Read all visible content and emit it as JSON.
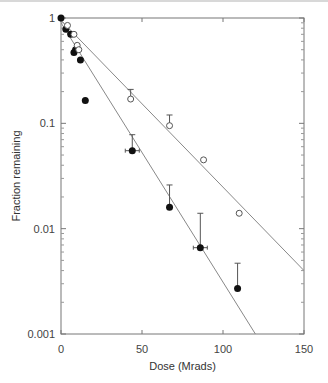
{
  "chart_data": {
    "type": "scatter",
    "title": "",
    "xlabel": "Dose (Mrads)",
    "ylabel": "Fraction remaining",
    "xlim": [
      0,
      150
    ],
    "ylim": [
      0.001,
      1
    ],
    "yscale": "log",
    "x_ticks": [
      "0",
      "50",
      "100",
      "150"
    ],
    "y_ticks": [
      "0.001",
      "0.01",
      "0.1",
      "1"
    ],
    "grid": false,
    "series": [
      {
        "name": "filled",
        "marker": "filled-circle",
        "color": "#111111",
        "points": [
          {
            "x": 0,
            "y": 1.0
          },
          {
            "x": 3,
            "y": 0.78
          },
          {
            "x": 6,
            "y": 0.7
          },
          {
            "x": 8,
            "y": 0.47
          },
          {
            "x": 9,
            "y": 0.5
          },
          {
            "x": 12,
            "y": 0.4
          },
          {
            "x": 15,
            "y": 0.165
          },
          {
            "x": 44,
            "y": 0.055
          },
          {
            "x": 67,
            "y": 0.016
          },
          {
            "x": 86,
            "y": 0.0066
          },
          {
            "x": 109,
            "y": 0.0027
          }
        ],
        "fit_line": {
          "x0": 0,
          "y0": 0.9,
          "x1": 120,
          "y1": 0.001
        }
      },
      {
        "name": "open",
        "marker": "open-circle",
        "color": "#555555",
        "points": [
          {
            "x": 4,
            "y": 0.85
          },
          {
            "x": 8,
            "y": 0.7
          },
          {
            "x": 10,
            "y": 0.55
          },
          {
            "x": 11,
            "y": 0.5
          },
          {
            "x": 43,
            "y": 0.17
          },
          {
            "x": 67,
            "y": 0.095
          },
          {
            "x": 88,
            "y": 0.045
          },
          {
            "x": 110,
            "y": 0.014
          }
        ],
        "fit_line": {
          "x0": 0,
          "y0": 0.95,
          "x1": 150,
          "y1": 0.004
        }
      }
    ]
  }
}
